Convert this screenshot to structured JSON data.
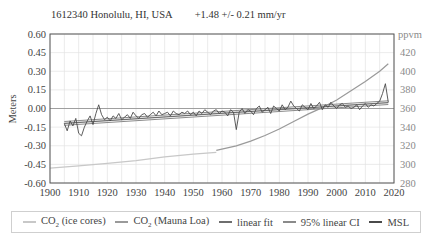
{
  "header": {
    "station": "1612340 Honolulu, HI, USA",
    "rate": "+1.48 +/- 0.21 mm/yr"
  },
  "colors": {
    "co2_ice": "#c8c8c8",
    "co2_mauna_loa": "#9a9a9a",
    "linear_fit": "#6e6e6e",
    "ci": "#8a8a8a",
    "msl": "#4a4a4a",
    "grid": "#e2e2e2",
    "axis": "#555555"
  },
  "legend": [
    {
      "key": "co2_ice",
      "prefix": "CO",
      "sub": "2",
      "suffix": " (ice cores)"
    },
    {
      "key": "co2_mauna_loa",
      "prefix": "CO",
      "sub": "2",
      "suffix": " (Mauna Loa)"
    },
    {
      "key": "linear_fit",
      "prefix": "linear fit",
      "sub": "",
      "suffix": ""
    },
    {
      "key": "ci",
      "prefix": "95% linear CI",
      "sub": "",
      "suffix": ""
    },
    {
      "key": "msl",
      "prefix": "MSL",
      "sub": "",
      "suffix": ""
    }
  ],
  "chart_data": {
    "type": "line",
    "xlabel": "",
    "ylabel": "Meters",
    "y2label": "ppvm",
    "xlim": [
      1900,
      2020
    ],
    "ylim": [
      -0.6,
      0.6
    ],
    "y2lim": [
      280,
      440
    ],
    "xticks": [
      1900,
      1910,
      1920,
      1930,
      1940,
      1950,
      1960,
      1970,
      1980,
      1990,
      2000,
      2010,
      2020
    ],
    "yticks": [
      0.6,
      0.45,
      0.3,
      0.15,
      0.0,
      -0.15,
      -0.3,
      -0.45,
      -0.6
    ],
    "y2ticks": [
      420,
      400,
      380,
      360,
      340,
      320,
      300,
      280
    ],
    "grid": true,
    "legend_position": "bottom",
    "series": [
      {
        "name": "CO2 (ice cores)",
        "axis": "right",
        "x": [
          1900,
          1910,
          1920,
          1930,
          1940,
          1950,
          1958
        ],
        "values": [
          296,
          298.5,
          301,
          304,
          308,
          311,
          313
        ]
      },
      {
        "name": "CO2 (Mauna Loa)",
        "axis": "right",
        "x": [
          1958,
          1965,
          1970,
          1975,
          1980,
          1985,
          1990,
          1995,
          2000,
          2005,
          2010,
          2015,
          2018
        ],
        "values": [
          315,
          320,
          325,
          331,
          338,
          346,
          354,
          361,
          369,
          379,
          389,
          400,
          408
        ]
      },
      {
        "name": "linear fit",
        "axis": "left",
        "x": [
          1905,
          2018
        ],
        "values": [
          -0.12,
          0.047
        ]
      },
      {
        "name": "95% linear CI upper",
        "axis": "left",
        "x": [
          1905,
          2018
        ],
        "values": [
          -0.105,
          0.062
        ]
      },
      {
        "name": "95% linear CI lower",
        "axis": "left",
        "x": [
          1905,
          2018
        ],
        "values": [
          -0.135,
          0.032
        ]
      },
      {
        "name": "MSL",
        "axis": "left",
        "x": [
          1905,
          1906,
          1907,
          1908,
          1909,
          1910,
          1911,
          1912,
          1913,
          1914,
          1915,
          1916,
          1917,
          1918,
          1919,
          1920,
          1921,
          1922,
          1923,
          1924,
          1925,
          1926,
          1927,
          1928,
          1929,
          1930,
          1931,
          1932,
          1933,
          1934,
          1935,
          1936,
          1937,
          1938,
          1939,
          1940,
          1941,
          1942,
          1943,
          1944,
          1945,
          1946,
          1947,
          1948,
          1949,
          1950,
          1951,
          1952,
          1953,
          1954,
          1955,
          1956,
          1957,
          1958,
          1959,
          1960,
          1961,
          1962,
          1963,
          1964,
          1965,
          1966,
          1967,
          1968,
          1969,
          1970,
          1971,
          1972,
          1973,
          1974,
          1975,
          1976,
          1977,
          1978,
          1979,
          1980,
          1981,
          1982,
          1983,
          1984,
          1985,
          1986,
          1987,
          1988,
          1989,
          1990,
          1991,
          1992,
          1993,
          1994,
          1995,
          1996,
          1997,
          1998,
          1999,
          2000,
          2001,
          2002,
          2003,
          2004,
          2005,
          2006,
          2007,
          2008,
          2009,
          2010,
          2011,
          2012,
          2013,
          2014,
          2015,
          2016,
          2017,
          2018
        ],
        "values": [
          -0.12,
          -0.18,
          -0.1,
          -0.14,
          -0.08,
          -0.2,
          -0.22,
          -0.15,
          -0.1,
          -0.06,
          -0.13,
          -0.04,
          0.03,
          -0.05,
          -0.09,
          -0.07,
          -0.1,
          -0.06,
          -0.08,
          -0.04,
          -0.09,
          -0.07,
          -0.05,
          -0.08,
          -0.03,
          -0.06,
          -0.08,
          -0.05,
          -0.04,
          -0.07,
          -0.05,
          -0.03,
          -0.06,
          -0.02,
          -0.05,
          -0.04,
          -0.03,
          -0.06,
          -0.02,
          -0.04,
          -0.05,
          -0.03,
          -0.04,
          -0.02,
          -0.05,
          -0.03,
          -0.06,
          -0.02,
          -0.04,
          -0.01,
          -0.03,
          -0.05,
          -0.02,
          -0.01,
          -0.04,
          -0.02,
          -0.03,
          -0.06,
          -0.01,
          -0.03,
          -0.17,
          -0.03,
          0.0,
          -0.04,
          -0.01,
          -0.02,
          -0.05,
          0.0,
          0.02,
          -0.03,
          -0.01,
          0.01,
          -0.04,
          0.02,
          0.0,
          -0.02,
          0.03,
          -0.01,
          0.01,
          0.06,
          0.02,
          0.0,
          -0.02,
          0.03,
          0.01,
          -0.01,
          0.04,
          0.0,
          0.02,
          0.05,
          -0.01,
          0.03,
          0.01,
          0.05,
          0.02,
          0.0,
          0.03,
          0.04,
          0.01,
          0.02,
          0.0,
          0.01,
          0.03,
          -0.01,
          0.02,
          0.04,
          0.01,
          0.03,
          0.02,
          0.04,
          0.06,
          0.12,
          0.2,
          0.05
        ]
      }
    ]
  }
}
